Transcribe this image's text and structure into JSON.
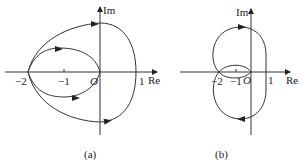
{
  "panels": [
    {
      "id": "a",
      "caption": "(a)",
      "axes": {
        "x_label": "Re",
        "y_label": "Im",
        "origin_label": "O",
        "ticks": [
          {
            "value": -2,
            "label": "−2"
          },
          {
            "value": -1,
            "label": "−1"
          },
          {
            "value": 1,
            "label": "1"
          }
        ]
      },
      "curves": [
        {
          "name": "outer-contour",
          "description": "Closed curve through -2, top crossing Im axis, right crossing at 1, bottom crossing Im axis"
        },
        {
          "name": "inner-loop",
          "description": "Ellipse-like loop between -2 and O"
        }
      ]
    },
    {
      "id": "b",
      "caption": "(b)",
      "axes": {
        "x_label": "Re",
        "y_label": "Im",
        "origin_label": "O",
        "ticks": [
          {
            "value": -2,
            "label": "−2"
          },
          {
            "value": -1,
            "label": "−1"
          },
          {
            "value": 1,
            "label": "1"
          }
        ]
      },
      "curves": [
        {
          "name": "upper-loop",
          "description": "Upper lobe from -2 up and around to 1"
        },
        {
          "name": "lower-loop",
          "description": "Lower lobe from 1 down and around to -2"
        },
        {
          "name": "small-loop",
          "description": "Small lens-shaped loop between -2 and O"
        }
      ]
    }
  ]
}
